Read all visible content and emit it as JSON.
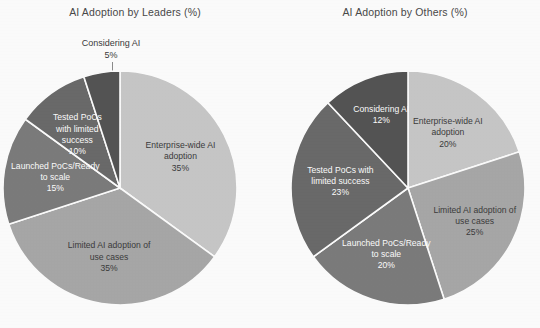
{
  "figure": {
    "background_color": "#ffffff",
    "slice_border_color": "#ffffff",
    "leader_line_color": "#8d8d8d"
  },
  "charts": {
    "left": {
      "title": "AI Adoption by Leaders (%)",
      "slices": [
        {
          "label": "Enterprise-wide AI\nadoption",
          "value_label": "35%",
          "value": 35,
          "color": "#c9c9c9",
          "text_color": "dark"
        },
        {
          "label": "Limited AI adoption of\nuse cases",
          "value_label": "35%",
          "value": 35,
          "color": "#a9a9a9",
          "text_color": "dark"
        },
        {
          "label": "Launched PoCs/Ready\nto scale",
          "value_label": "15%",
          "value": 15,
          "color": "#7d7d7d",
          "text_color": "light"
        },
        {
          "label": "Tested PoCs\nwith limited\nsuccess",
          "value_label": "10%",
          "value": 10,
          "color": "#6b6b6b",
          "text_color": "light"
        },
        {
          "label": "Considering AI",
          "value_label": "5%",
          "value": 5,
          "color": "#555555",
          "text_color": "dark"
        }
      ]
    },
    "right": {
      "title": "AI Adoption by Others (%)",
      "slices": [
        {
          "label": "Enterprise-wide AI\nadoption",
          "value_label": "20%",
          "value": 20,
          "color": "#c9c9c9",
          "text_color": "dark"
        },
        {
          "label": "Limited AI adoption of\nuse cases",
          "value_label": "25%",
          "value": 25,
          "color": "#a9a9a9",
          "text_color": "dark"
        },
        {
          "label": "Launched PoCs/Ready\nto scale",
          "value_label": "20%",
          "value": 20,
          "color": "#7d7d7d",
          "text_color": "light"
        },
        {
          "label": "Tested PoCs with\nlimited success",
          "value_label": "23%",
          "value": 23,
          "color": "#6b6b6b",
          "text_color": "light"
        },
        {
          "label": "Considering AI",
          "value_label": "12%",
          "value": 12,
          "color": "#555555",
          "text_color": "light"
        }
      ]
    }
  },
  "chart_data": [
    {
      "type": "pie",
      "title": "AI Adoption by Leaders (%)",
      "categories": [
        "Enterprise-wide AI adoption",
        "Limited AI adoption of use cases",
        "Launched PoCs/Ready to scale",
        "Tested PoCs with limited success",
        "Considering AI"
      ],
      "values": [
        35,
        35,
        15,
        10,
        5
      ],
      "value_labels": [
        "35%",
        "35%",
        "15%",
        "10%",
        "5%"
      ],
      "unit": "%",
      "total": 100,
      "colors": [
        "#c9c9c9",
        "#a9a9a9",
        "#7d7d7d",
        "#6b6b6b",
        "#555555"
      ],
      "start_angle_deg": 0,
      "direction": "clockwise",
      "labels_inside": true,
      "legend": "none",
      "grid": false,
      "annotations": [
        "Considering AI 5% label placed outside with leader line"
      ],
      "xlabel": "",
      "ylabel": ""
    },
    {
      "type": "pie",
      "title": "AI Adoption by Others (%)",
      "categories": [
        "Enterprise-wide AI adoption",
        "Limited AI adoption of use cases",
        "Launched PoCs/Ready to scale",
        "Tested PoCs with limited success",
        "Considering AI"
      ],
      "values": [
        20,
        25,
        20,
        23,
        12
      ],
      "value_labels": [
        "20%",
        "25%",
        "20%",
        "23%",
        "12%"
      ],
      "unit": "%",
      "total": 100,
      "colors": [
        "#c9c9c9",
        "#a9a9a9",
        "#7d7d7d",
        "#6b6b6b",
        "#555555"
      ],
      "start_angle_deg": 0,
      "direction": "clockwise",
      "labels_inside": true,
      "legend": "none",
      "grid": false,
      "annotations": [],
      "xlabel": "",
      "ylabel": ""
    }
  ]
}
